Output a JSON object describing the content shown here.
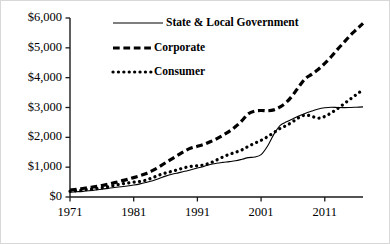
{
  "chart_data": {
    "type": "line",
    "title": "",
    "subtitle": "",
    "xlabel": "",
    "ylabel": "",
    "xlim": [
      1971,
      2017
    ],
    "ylim": [
      0,
      6000
    ],
    "grid": false,
    "legend_position": "top-center",
    "value_prefix": "$",
    "xticks": [
      "1971",
      "1981",
      "1991",
      "2001",
      "2011"
    ],
    "xtick_values": [
      1971,
      1981,
      1991,
      2001,
      2011
    ],
    "yticks": [
      "$0",
      "$1,000",
      "$2,000",
      "$3,000",
      "$4,000",
      "$5,000",
      "$6,000"
    ],
    "ytick_values": [
      0,
      1000,
      2000,
      3000,
      4000,
      5000,
      6000
    ],
    "x": [
      1971,
      1972,
      1973,
      1974,
      1975,
      1976,
      1977,
      1978,
      1979,
      1980,
      1981,
      1982,
      1983,
      1984,
      1985,
      1986,
      1987,
      1988,
      1989,
      1990,
      1991,
      1992,
      1993,
      1994,
      1995,
      1996,
      1997,
      1998,
      1999,
      2000,
      2001,
      2002,
      2003,
      2004,
      2005,
      2006,
      2007,
      2008,
      2009,
      2010,
      2011,
      2012,
      2013,
      2014,
      2015,
      2016,
      2017
    ],
    "series": [
      {
        "name": "State & Local Government",
        "style": "solid",
        "color": "#000000",
        "width": 1.1,
        "values": [
          160,
          175,
          190,
          210,
          235,
          260,
          290,
          320,
          345,
          370,
          400,
          440,
          490,
          545,
          620,
          700,
          760,
          810,
          860,
          915,
          970,
          1025,
          1090,
          1130,
          1160,
          1185,
          1215,
          1265,
          1320,
          1340,
          1420,
          1700,
          2100,
          2400,
          2520,
          2620,
          2720,
          2810,
          2880,
          2950,
          2990,
          3010,
          3000,
          2995,
          3000,
          3010,
          3020
        ]
      },
      {
        "name": "Corporate",
        "style": "dashed",
        "color": "#000000",
        "width": 3.2,
        "values": [
          230,
          255,
          285,
          320,
          350,
          385,
          430,
          480,
          535,
          590,
          650,
          715,
          790,
          890,
          1010,
          1150,
          1280,
          1410,
          1540,
          1640,
          1700,
          1760,
          1850,
          1950,
          2070,
          2200,
          2360,
          2560,
          2790,
          2880,
          2900,
          2890,
          2920,
          3020,
          3180,
          3420,
          3720,
          3980,
          4120,
          4280,
          4480,
          4700,
          4950,
          5180,
          5420,
          5620,
          5820
        ]
      },
      {
        "name": "Consumer",
        "style": "dotted",
        "color": "#000000",
        "width": 3.2,
        "values": [
          190,
          210,
          235,
          255,
          275,
          305,
          345,
          390,
          435,
          465,
          495,
          520,
          570,
          650,
          735,
          805,
          860,
          920,
          985,
          1025,
          1045,
          1075,
          1140,
          1240,
          1340,
          1430,
          1500,
          1580,
          1700,
          1800,
          1900,
          2020,
          2160,
          2300,
          2400,
          2530,
          2670,
          2750,
          2700,
          2640,
          2700,
          2820,
          2960,
          3120,
          3280,
          3440,
          3600
        ]
      }
    ]
  },
  "axis": {
    "y_axis_name": "dollar-amount-axis",
    "x_axis_name": "year-axis"
  }
}
